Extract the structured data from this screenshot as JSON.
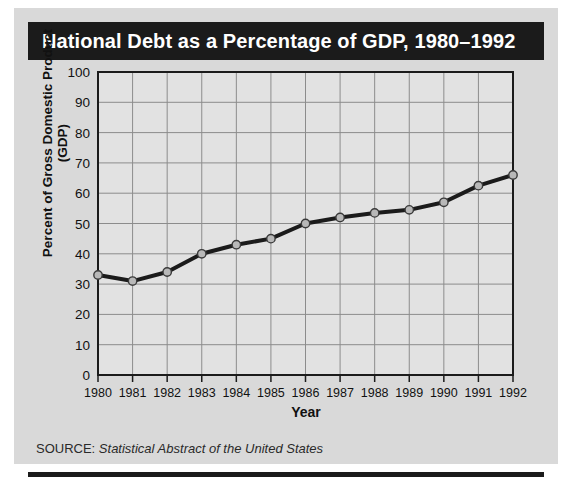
{
  "figure": {
    "title": "National Debt as a Percentage of GDP, 1980–1992",
    "source_label": "SOURCE:",
    "source_title": "Statistical Abstract of the United States",
    "colors": {
      "card_background": "#d9d9d9",
      "title_bar": "#1b1b1b",
      "title_text": "#ffffff",
      "plot_background": "#e2e2e2",
      "gridline": "#8c8c8c",
      "axis": "#1b1b1b",
      "line": "#1b1b1b",
      "marker_fill": "#b8b8b8",
      "marker_edge": "#3a3a3a",
      "text": "#111111"
    }
  },
  "chart_data": {
    "type": "line",
    "title": "National Debt as a Percentage of GDP, 1980–1992",
    "xlabel": "Year",
    "ylabel": "Percent of Gross Domestic Product\n(GDP)",
    "categories": [
      "1980",
      "1981",
      "1982",
      "1983",
      "1984",
      "1985",
      "1986",
      "1987",
      "1988",
      "1989",
      "1990",
      "1991",
      "1992"
    ],
    "values": [
      33,
      31,
      34,
      40,
      43,
      45,
      50,
      52,
      53.5,
      54.5,
      57,
      62.5,
      66
    ],
    "ylim": [
      0,
      100
    ],
    "ytick_labels": [
      "0",
      "10",
      "20",
      "30",
      "40",
      "50",
      "60",
      "70",
      "80",
      "90",
      "100"
    ],
    "ytick_values": [
      0,
      10,
      20,
      30,
      40,
      50,
      60,
      70,
      80,
      90,
      100
    ],
    "grid": true,
    "legend": "none",
    "markers": "circle"
  }
}
